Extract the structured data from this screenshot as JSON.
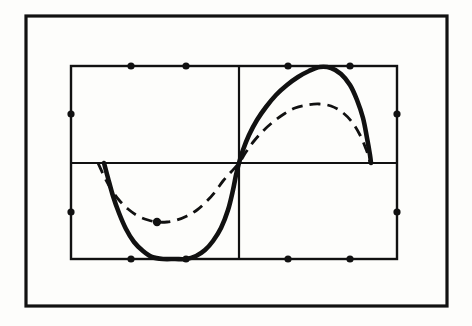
{
  "figure": {
    "kind": "scanned-line-plot",
    "paper_color": "#fdfdfb",
    "ink_color": "#111111",
    "title": "",
    "caption": "",
    "outer_frame": {
      "name": "outer-border",
      "x": 26,
      "y": 16,
      "width": 421,
      "height": 290,
      "stroke_width": 3.2,
      "color": "#111111"
    },
    "plot_box": {
      "name": "plot-frame",
      "left": 71,
      "top": 66,
      "right": 397,
      "bottom": 259,
      "stroke_width": 2.4,
      "color": "#111111"
    },
    "axes": {
      "x_axis_y": 163,
      "y_axis_x": 239,
      "stroke_width": 2.2,
      "color": "#111111"
    },
    "tick_marks": {
      "style": "filled-dot",
      "radius": 3.6,
      "color": "#111111",
      "top_edge_x": [
        131,
        186,
        288,
        350
      ],
      "bottom_edge_x": [
        131,
        186,
        288,
        350
      ],
      "left_edge_y": [
        114,
        212
      ],
      "right_edge_y": [
        114,
        212
      ]
    },
    "marker_points": [
      {
        "name": "dashed-curve-minimum-marker",
        "x": 157,
        "y": 222,
        "radius": 4.2,
        "color": "#111111"
      }
    ]
  },
  "chart_data": {
    "type": "line",
    "title": "",
    "subtitle": "",
    "xlabel": "",
    "ylabel": "",
    "grid": true,
    "legend_position": "none",
    "xlim": [
      -1,
      1
    ],
    "ylim": [
      -1,
      1
    ],
    "xticks": [
      -0.632,
      -0.294,
      0.301,
      0.681
    ],
    "yticks": [
      0.508,
      -0.508
    ],
    "axis_origin": [
      0,
      0
    ],
    "series": [
      {
        "name": "solid-curve",
        "style": "solid",
        "stroke_width": 4.6,
        "color": "#111111",
        "description": "heavy hand-drawn sine-like curve, clipped flat at bottom frame and touching top frame at its peak",
        "points_px": [
          [
            104,
            163
          ],
          [
            108,
            178
          ],
          [
            113,
            196
          ],
          [
            119,
            213
          ],
          [
            126,
            229
          ],
          [
            134,
            242
          ],
          [
            143,
            251
          ],
          [
            152,
            257
          ],
          [
            163,
            259
          ],
          [
            175,
            259
          ],
          [
            186,
            259
          ],
          [
            196,
            256
          ],
          [
            205,
            250
          ],
          [
            213,
            241
          ],
          [
            221,
            228
          ],
          [
            228,
            210
          ],
          [
            233,
            190
          ],
          [
            236,
            175
          ],
          [
            239,
            163
          ],
          [
            243,
            150
          ],
          [
            249,
            135
          ],
          [
            257,
            120
          ],
          [
            266,
            107
          ],
          [
            276,
            95
          ],
          [
            287,
            85
          ],
          [
            298,
            77
          ],
          [
            309,
            71
          ],
          [
            320,
            67
          ],
          [
            331,
            68
          ],
          [
            341,
            74
          ],
          [
            350,
            85
          ],
          [
            357,
            100
          ],
          [
            363,
            118
          ],
          [
            367,
            138
          ],
          [
            370,
            155
          ],
          [
            371,
            163
          ]
        ]
      },
      {
        "name": "dashed-curve",
        "style": "dashed",
        "stroke_width": 2.8,
        "dash_pattern": "11 7",
        "color": "#111111",
        "description": "lighter dashed comparison curve of smaller amplitude, same zero crossings",
        "points_px": [
          [
            98,
            163
          ],
          [
            104,
            176
          ],
          [
            111,
            189
          ],
          [
            119,
            200
          ],
          [
            128,
            209
          ],
          [
            138,
            216
          ],
          [
            148,
            220
          ],
          [
            157,
            222
          ],
          [
            167,
            222
          ],
          [
            177,
            220
          ],
          [
            187,
            216
          ],
          [
            197,
            210
          ],
          [
            206,
            202
          ],
          [
            215,
            192
          ],
          [
            223,
            181
          ],
          [
            231,
            172
          ],
          [
            239,
            163
          ],
          [
            246,
            152
          ],
          [
            254,
            141
          ],
          [
            263,
            131
          ],
          [
            273,
            122
          ],
          [
            284,
            114
          ],
          [
            295,
            108
          ],
          [
            307,
            105
          ],
          [
            319,
            104
          ],
          [
            331,
            106
          ],
          [
            342,
            112
          ],
          [
            352,
            122
          ],
          [
            360,
            135
          ],
          [
            366,
            149
          ],
          [
            369,
            158
          ],
          [
            370,
            163
          ]
        ]
      }
    ]
  }
}
